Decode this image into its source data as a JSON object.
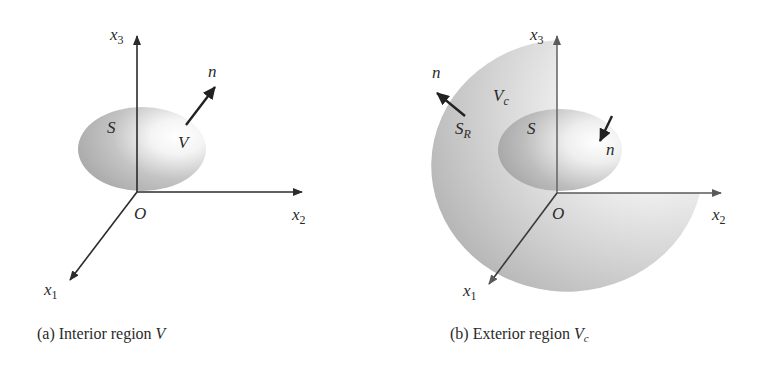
{
  "panels": [
    {
      "id": "a",
      "caption": {
        "prefix": "(a) Interior region ",
        "var": "V"
      },
      "labels": {
        "x3": "x",
        "x3_sub": "3",
        "x2": "x",
        "x2_sub": "2",
        "x1": "x",
        "x1_sub": "1",
        "origin": "O",
        "surface": "S",
        "region": "V",
        "normal": "n"
      }
    },
    {
      "id": "b",
      "caption": {
        "prefix": "(b) Exterior region ",
        "var": "V",
        "var_sub": "c"
      },
      "labels": {
        "x3": "x",
        "x3_sub": "3",
        "x2": "x",
        "x2_sub": "2",
        "x1": "x",
        "x1_sub": "1",
        "origin": "O",
        "surface": "S",
        "outer_surface": "S",
        "outer_surface_sub": "R",
        "region": "V",
        "region_sub": "c",
        "normal_outer": "n",
        "normal_inner": "n"
      }
    }
  ],
  "colors": {
    "axis": "#2b2b2b",
    "axis_b": "#6a6a6a",
    "shade_dark": "#a9a9a9",
    "shade_light": "#ffffff"
  }
}
